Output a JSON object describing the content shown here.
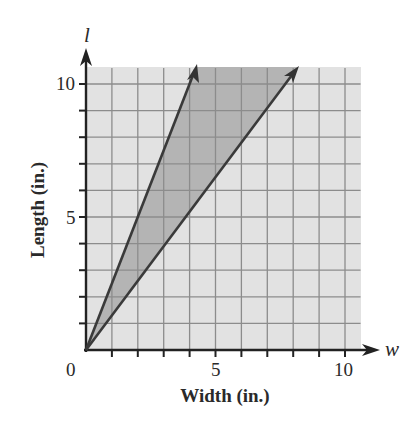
{
  "chart_data": {
    "type": "line",
    "title": "",
    "xlabel": "Width (in.)",
    "ylabel": "Length (in.)",
    "x_variable": "w",
    "y_variable": "l",
    "xlim": [
      0,
      10.6
    ],
    "ylim": [
      0,
      10.6
    ],
    "x_ticks": [
      0,
      1,
      2,
      3,
      4,
      5,
      6,
      7,
      8,
      9,
      10
    ],
    "y_ticks": [
      0,
      1,
      2,
      3,
      4,
      5,
      6,
      7,
      8,
      9,
      10
    ],
    "x_tick_labels": [
      {
        "value": 0,
        "label": "0"
      },
      {
        "value": 5,
        "label": "5"
      },
      {
        "value": 10,
        "label": "10"
      }
    ],
    "y_tick_labels": [
      {
        "value": 5,
        "label": "5"
      },
      {
        "value": 10,
        "label": "10"
      }
    ],
    "grid": true,
    "legend": null,
    "series": [
      {
        "name": "upper boundary ray",
        "equation": "l = 2.5w",
        "slope": 2.5,
        "points": [
          [
            0,
            0
          ],
          [
            4.25,
            10.6
          ]
        ],
        "arrow": true
      },
      {
        "name": "lower boundary ray",
        "equation": "l = (4/3)w",
        "slope": 1.333,
        "points": [
          [
            0,
            0
          ],
          [
            8.0,
            10.6
          ]
        ],
        "arrow": true
      }
    ],
    "shaded_region": {
      "description": "region between the two rays (feasible region)",
      "between": [
        "l = 2.5w",
        "l = (4/3)w"
      ]
    }
  },
  "labels": {
    "x_title": "Width (in.)",
    "y_title": "Length (in.)",
    "x_var": "w",
    "y_var": "l",
    "origin": "0",
    "x5": "5",
    "x10": "10",
    "y5": "5",
    "y10": "10"
  },
  "colors": {
    "background_fill": "#e2e2e2",
    "wedge_fill": "#b4b4b4",
    "grid": "#8c8c8c",
    "axis": "#222222",
    "ray": "#3a3a3a"
  }
}
